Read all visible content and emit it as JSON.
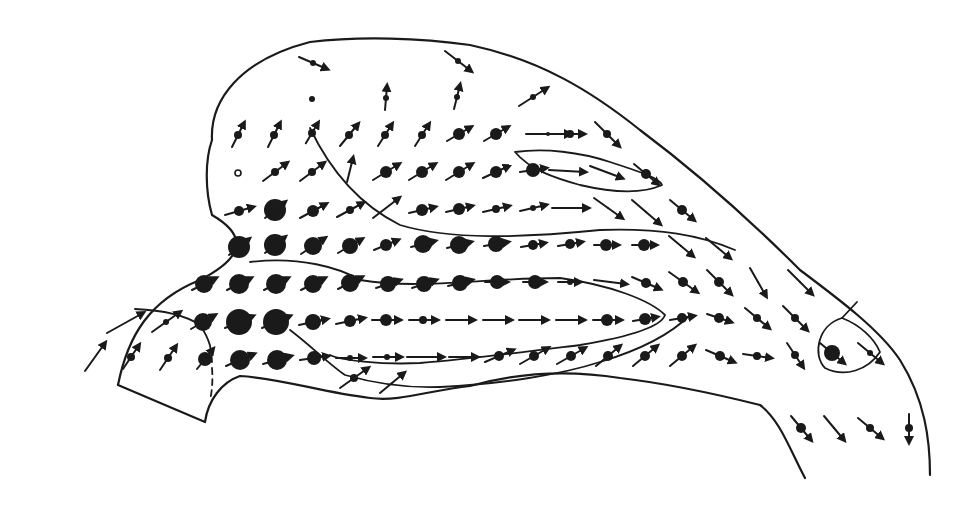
{
  "figure": {
    "type": "vector-field-diagram",
    "width": 966,
    "height": 506,
    "ink_color": "#1a1a1a",
    "background": "#ffffff",
    "outline_path": "M118,385 C128,335 150,300 200,280 C235,262 255,240 212,215 C205,190 205,160 212,140 C210,100 240,60 310,42 C360,36 420,38 470,45 C540,60 590,90 640,130 C700,175 760,230 800,270 C840,300 880,330 900,360 C925,400 930,440 930,475",
    "outline_bottom_path": "M118,385 L205,422 C208,400 222,382 240,376 C280,378 320,392 370,398 C400,402 430,390 470,386 C520,372 570,370 620,378 C680,385 740,400 760,405 C780,420 790,450 805,478",
    "contours": [
      {
        "name": "upper-lobe",
        "path": "M310,128 C330,170 360,205 400,225 C450,240 520,238 600,230 C660,228 700,235 735,250",
        "dashed": false
      },
      {
        "name": "middle-lobe",
        "path": "M250,262 C300,256 340,268 360,280 C420,290 480,278 560,278 C610,285 650,300 665,315 C660,330 610,340 580,345 C540,350 480,358 420,363 C380,365 340,360 330,355",
        "dashed": false
      },
      {
        "name": "inner-upper-loop",
        "path": "M515,152 C545,148 580,152 610,162 C635,170 660,178 662,185 C640,195 610,192 580,185 C555,178 530,170 515,152 Z",
        "dashed": false
      },
      {
        "name": "left-inflow",
        "path": "M135,309 C160,310 185,315 200,325 C210,340 212,350 212,362",
        "dashed": false
      },
      {
        "name": "left-dashed",
        "path": "M212,368 C213,380 212,392 210,400",
        "dashed": true
      },
      {
        "name": "lower-sweep",
        "path": "M290,330 C310,345 330,365 345,375 C380,385 410,388 440,387 C500,384 560,375 600,362 C640,350 670,335 690,315",
        "dashed": false
      },
      {
        "name": "right-circle",
        "path": "M842,318 C818,325 812,355 825,368 C845,378 868,370 880,352 C874,338 860,325 842,318 Z",
        "dashed": false
      },
      {
        "name": "right-tick",
        "path": "M842,318 L857,302",
        "dashed": false
      }
    ],
    "vectors": [
      {
        "x": 313,
        "y": 63,
        "dx": 14,
        "dy": 6,
        "r": 3
      },
      {
        "x": 458,
        "y": 61,
        "dx": 13,
        "dy": 10,
        "r": 3
      },
      {
        "x": 312,
        "y": 99,
        "dx": 0,
        "dy": 0,
        "r": 3
      },
      {
        "x": 386,
        "y": 98,
        "dx": 1,
        "dy": -12,
        "r": 3
      },
      {
        "x": 457,
        "y": 97,
        "dx": 3,
        "dy": -12,
        "r": 3
      },
      {
        "x": 533,
        "y": 97,
        "dx": 14,
        "dy": -9,
        "r": 3
      },
      {
        "x": 238,
        "y": 135,
        "dx": 6,
        "dy": -12,
        "r": 4
      },
      {
        "x": 274,
        "y": 135,
        "dx": 6,
        "dy": -12,
        "r": 4
      },
      {
        "x": 312,
        "y": 133,
        "dx": 6,
        "dy": -10,
        "r": 4
      },
      {
        "x": 349,
        "y": 135,
        "dx": 9,
        "dy": -11,
        "r": 4
      },
      {
        "x": 385,
        "y": 135,
        "dx": 7,
        "dy": -11,
        "r": 4
      },
      {
        "x": 422,
        "y": 135,
        "dx": 7,
        "dy": -11,
        "r": 4
      },
      {
        "x": 459,
        "y": 134,
        "dx": 12,
        "dy": -7,
        "r": 6
      },
      {
        "x": 496,
        "y": 134,
        "dx": 12,
        "dy": -7,
        "r": 6
      },
      {
        "x": 548,
        "y": 134,
        "dx": 22,
        "dy": 0,
        "r": 2
      },
      {
        "x": 570,
        "y": 134,
        "dx": 14,
        "dy": 0,
        "r": 4
      },
      {
        "x": 607,
        "y": 134,
        "dx": 12,
        "dy": 12,
        "r": 4
      },
      {
        "x": 238,
        "y": 173,
        "dx": 0,
        "dy": 0,
        "r": 3,
        "hollow": true
      },
      {
        "x": 275,
        "y": 172,
        "dx": 12,
        "dy": -9,
        "r": 4
      },
      {
        "x": 312,
        "y": 172,
        "dx": 12,
        "dy": -9,
        "r": 4
      },
      {
        "x": 350,
        "y": 170,
        "dx": 3,
        "dy": -12,
        "r": 0
      },
      {
        "x": 386,
        "y": 172,
        "dx": 13,
        "dy": -8,
        "r": 6
      },
      {
        "x": 422,
        "y": 172,
        "dx": 13,
        "dy": -8,
        "r": 6
      },
      {
        "x": 459,
        "y": 172,
        "dx": 13,
        "dy": -8,
        "r": 6
      },
      {
        "x": 496,
        "y": 172,
        "dx": 13,
        "dy": -6,
        "r": 6
      },
      {
        "x": 533,
        "y": 170,
        "dx": 13,
        "dy": -2,
        "r": 7
      },
      {
        "x": 567,
        "y": 171,
        "dx": 18,
        "dy": 1,
        "r": 1
      },
      {
        "x": 606,
        "y": 172,
        "dx": 16,
        "dy": 6,
        "r": 1
      },
      {
        "x": 646,
        "y": 174,
        "dx": 12,
        "dy": 10,
        "r": 5
      },
      {
        "x": 239,
        "y": 211,
        "dx": 14,
        "dy": -4,
        "r": 5
      },
      {
        "x": 275,
        "y": 210,
        "dx": 10,
        "dy": -8,
        "r": 11
      },
      {
        "x": 313,
        "y": 211,
        "dx": 13,
        "dy": -7,
        "r": 6
      },
      {
        "x": 350,
        "y": 210,
        "dx": 13,
        "dy": -7,
        "r": 4
      },
      {
        "x": 386,
        "y": 208,
        "dx": 13,
        "dy": -10,
        "r": 0
      },
      {
        "x": 422,
        "y": 210,
        "dx": 13,
        "dy": -3,
        "r": 6
      },
      {
        "x": 459,
        "y": 209,
        "dx": 13,
        "dy": -3,
        "r": 6
      },
      {
        "x": 496,
        "y": 209,
        "dx": 13,
        "dy": -3,
        "r": 4
      },
      {
        "x": 533,
        "y": 208,
        "dx": 13,
        "dy": -3,
        "r": 3
      },
      {
        "x": 570,
        "y": 208,
        "dx": 18,
        "dy": 0,
        "r": 1
      },
      {
        "x": 608,
        "y": 208,
        "dx": 14,
        "dy": 10,
        "r": 1
      },
      {
        "x": 646,
        "y": 212,
        "dx": 14,
        "dy": 12,
        "r": 1
      },
      {
        "x": 682,
        "y": 210,
        "dx": 12,
        "dy": 10,
        "r": 5
      },
      {
        "x": 239,
        "y": 247,
        "dx": 10,
        "dy": -8,
        "r": 11
      },
      {
        "x": 275,
        "y": 245,
        "dx": 10,
        "dy": -8,
        "r": 11
      },
      {
        "x": 313,
        "y": 246,
        "dx": 12,
        "dy": -8,
        "r": 9
      },
      {
        "x": 350,
        "y": 246,
        "dx": 12,
        "dy": -7,
        "r": 8
      },
      {
        "x": 386,
        "y": 245,
        "dx": 12,
        "dy": -5,
        "r": 6
      },
      {
        "x": 423,
        "y": 244,
        "dx": 12,
        "dy": -3,
        "r": 9
      },
      {
        "x": 459,
        "y": 245,
        "dx": 12,
        "dy": -3,
        "r": 9
      },
      {
        "x": 496,
        "y": 244,
        "dx": 12,
        "dy": -2,
        "r": 8
      },
      {
        "x": 533,
        "y": 245,
        "dx": 12,
        "dy": -2,
        "r": 5
      },
      {
        "x": 570,
        "y": 244,
        "dx": 12,
        "dy": -2,
        "r": 5
      },
      {
        "x": 606,
        "y": 245,
        "dx": 12,
        "dy": 0,
        "r": 6
      },
      {
        "x": 644,
        "y": 245,
        "dx": 12,
        "dy": 0,
        "r": 6
      },
      {
        "x": 681,
        "y": 246,
        "dx": 12,
        "dy": 10,
        "r": 1
      },
      {
        "x": 718,
        "y": 248,
        "dx": 12,
        "dy": 10,
        "r": 1
      },
      {
        "x": 204,
        "y": 284,
        "dx": 12,
        "dy": -6,
        "r": 9
      },
      {
        "x": 239,
        "y": 284,
        "dx": 12,
        "dy": -6,
        "r": 10
      },
      {
        "x": 276,
        "y": 284,
        "dx": 12,
        "dy": -6,
        "r": 10
      },
      {
        "x": 313,
        "y": 284,
        "dx": 12,
        "dy": -6,
        "r": 9
      },
      {
        "x": 350,
        "y": 283,
        "dx": 12,
        "dy": -6,
        "r": 9
      },
      {
        "x": 388,
        "y": 284,
        "dx": 12,
        "dy": -4,
        "r": 8
      },
      {
        "x": 424,
        "y": 284,
        "dx": 12,
        "dy": -4,
        "r": 8
      },
      {
        "x": 460,
        "y": 283,
        "dx": 12,
        "dy": -3,
        "r": 8
      },
      {
        "x": 497,
        "y": 282,
        "dx": 10,
        "dy": 0,
        "r": 7
      },
      {
        "x": 535,
        "y": 282,
        "dx": 10,
        "dy": 0,
        "r": 7
      },
      {
        "x": 570,
        "y": 282,
        "dx": 10,
        "dy": 0,
        "r": 3
      },
      {
        "x": 610,
        "y": 282,
        "dx": 16,
        "dy": 2,
        "r": 1
      },
      {
        "x": 646,
        "y": 283,
        "dx": 14,
        "dy": 6,
        "r": 5
      },
      {
        "x": 683,
        "y": 282,
        "dx": 14,
        "dy": 10,
        "r": 5
      },
      {
        "x": 719,
        "y": 282,
        "dx": 12,
        "dy": 12,
        "r": 5
      },
      {
        "x": 758,
        "y": 282,
        "dx": 8,
        "dy": 14,
        "r": 1
      },
      {
        "x": 800,
        "y": 282,
        "dx": 12,
        "dy": 12,
        "r": 1
      },
      {
        "x": 125,
        "y": 323,
        "dx": 18,
        "dy": -10,
        "r": 0
      },
      {
        "x": 166,
        "y": 322,
        "dx": 14,
        "dy": -10,
        "r": 3
      },
      {
        "x": 203,
        "y": 322,
        "dx": 12,
        "dy": -7,
        "r": 9
      },
      {
        "x": 239,
        "y": 322,
        "dx": 14,
        "dy": -6,
        "r": 13
      },
      {
        "x": 276,
        "y": 322,
        "dx": 14,
        "dy": -6,
        "r": 13
      },
      {
        "x": 313,
        "y": 322,
        "dx": 14,
        "dy": -3,
        "r": 8
      },
      {
        "x": 350,
        "y": 321,
        "dx": 14,
        "dy": -3,
        "r": 6
      },
      {
        "x": 386,
        "y": 320,
        "dx": 14,
        "dy": 0,
        "r": 6
      },
      {
        "x": 423,
        "y": 320,
        "dx": 14,
        "dy": 0,
        "r": 4
      },
      {
        "x": 460,
        "y": 320,
        "dx": 14,
        "dy": 0,
        "r": 1
      },
      {
        "x": 497,
        "y": 320,
        "dx": 14,
        "dy": 0,
        "r": 1
      },
      {
        "x": 533,
        "y": 320,
        "dx": 14,
        "dy": 0,
        "r": 1
      },
      {
        "x": 570,
        "y": 320,
        "dx": 14,
        "dy": 0,
        "r": 1
      },
      {
        "x": 607,
        "y": 320,
        "dx": 14,
        "dy": 0,
        "r": 6
      },
      {
        "x": 645,
        "y": 319,
        "dx": 12,
        "dy": -2,
        "r": 6
      },
      {
        "x": 682,
        "y": 318,
        "dx": 12,
        "dy": -2,
        "r": 5
      },
      {
        "x": 719,
        "y": 318,
        "dx": 12,
        "dy": 4,
        "r": 5
      },
      {
        "x": 757,
        "y": 318,
        "dx": 12,
        "dy": 10,
        "r": 4
      },
      {
        "x": 795,
        "y": 318,
        "dx": 12,
        "dy": 12,
        "r": 4
      },
      {
        "x": 95,
        "y": 357,
        "dx": 10,
        "dy": -14,
        "r": 0
      },
      {
        "x": 131,
        "y": 357,
        "dx": 8,
        "dy": -12,
        "r": 4
      },
      {
        "x": 168,
        "y": 358,
        "dx": 8,
        "dy": -12,
        "r": 4
      },
      {
        "x": 205,
        "y": 359,
        "dx": 8,
        "dy": -10,
        "r": 7
      },
      {
        "x": 240,
        "y": 360,
        "dx": 14,
        "dy": -6,
        "r": 10
      },
      {
        "x": 277,
        "y": 360,
        "dx": 14,
        "dy": -4,
        "r": 10
      },
      {
        "x": 314,
        "y": 358,
        "dx": 14,
        "dy": -2,
        "r": 7
      },
      {
        "x": 350,
        "y": 358,
        "dx": 14,
        "dy": 0,
        "r": 3
      },
      {
        "x": 387,
        "y": 357,
        "dx": 14,
        "dy": 0,
        "r": 3
      },
      {
        "x": 425,
        "y": 357,
        "dx": 18,
        "dy": 0,
        "r": 1
      },
      {
        "x": 463,
        "y": 357,
        "dx": 14,
        "dy": 0,
        "r": 1
      },
      {
        "x": 499,
        "y": 356,
        "dx": 14,
        "dy": -6,
        "r": 5
      },
      {
        "x": 534,
        "y": 356,
        "dx": 14,
        "dy": -8,
        "r": 5
      },
      {
        "x": 571,
        "y": 356,
        "dx": 14,
        "dy": -8,
        "r": 5
      },
      {
        "x": 608,
        "y": 356,
        "dx": 12,
        "dy": -10,
        "r": 5
      },
      {
        "x": 645,
        "y": 356,
        "dx": 12,
        "dy": -10,
        "r": 5
      },
      {
        "x": 682,
        "y": 356,
        "dx": 12,
        "dy": -10,
        "r": 5
      },
      {
        "x": 720,
        "y": 356,
        "dx": 14,
        "dy": 6,
        "r": 5
      },
      {
        "x": 757,
        "y": 356,
        "dx": 14,
        "dy": 2,
        "r": 4
      },
      {
        "x": 795,
        "y": 355,
        "dx": 8,
        "dy": 12,
        "r": 4
      },
      {
        "x": 832,
        "y": 353,
        "dx": 12,
        "dy": 10,
        "r": 8
      },
      {
        "x": 870,
        "y": 353,
        "dx": 12,
        "dy": 10,
        "r": 3
      },
      {
        "x": 354,
        "y": 378,
        "dx": 14,
        "dy": -10,
        "r": 4
      },
      {
        "x": 392,
        "y": 383,
        "dx": 12,
        "dy": -10,
        "r": 1
      },
      {
        "x": 801,
        "y": 428,
        "dx": 10,
        "dy": 12,
        "r": 5
      },
      {
        "x": 834,
        "y": 428,
        "dx": 10,
        "dy": 12,
        "r": 1
      },
      {
        "x": 870,
        "y": 428,
        "dx": 12,
        "dy": 10,
        "r": 4
      },
      {
        "x": 909,
        "y": 428,
        "dx": 0,
        "dy": 14,
        "r": 4
      }
    ]
  }
}
